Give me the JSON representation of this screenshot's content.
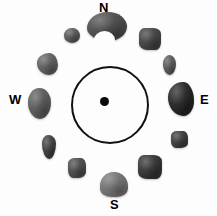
{
  "figure": {
    "background_color": "#fdfdfd",
    "width": 217,
    "height": 216
  },
  "center_marker": {
    "ring": {
      "name": "central-circle",
      "center_x": 110,
      "center_y": 105,
      "diameter": 78,
      "stroke_color": "#111111",
      "stroke_width": 2,
      "fill": "none"
    },
    "dot": {
      "name": "center-dot",
      "center_x": 104,
      "center_y": 101,
      "diameter": 9,
      "color": "#0a0a0a"
    }
  },
  "cardinals": [
    {
      "label": "N",
      "name": "cardinal-north",
      "x": 99,
      "y": 1,
      "color": "#000000"
    },
    {
      "label": "E",
      "name": "cardinal-east",
      "x": 200,
      "y": 93,
      "color": "#000000"
    },
    {
      "label": "S",
      "name": "cardinal-south",
      "x": 110,
      "y": 198,
      "color": "#000000"
    },
    {
      "label": "W",
      "name": "cardinal-west",
      "x": 9,
      "y": 93,
      "color": "#000000"
    }
  ],
  "stones": [
    {
      "id": 1,
      "position_label": "north",
      "x": 87,
      "y": 12,
      "w": 40,
      "h": 29,
      "shape": "kidney",
      "color": "#4f4f4f"
    },
    {
      "id": 2,
      "position_label": "north-northwest",
      "x": 64,
      "y": 28,
      "w": 16,
      "h": 15,
      "shape": "round",
      "color": "#5b5b5b"
    },
    {
      "id": 3,
      "position_label": "northeast",
      "x": 139,
      "y": 28,
      "w": 22,
      "h": 22,
      "shape": "angular",
      "color": "#454545"
    },
    {
      "id": 4,
      "position_label": "northwest",
      "x": 37,
      "y": 53,
      "w": 21,
      "h": 22,
      "shape": "blob",
      "color": "#636363"
    },
    {
      "id": 5,
      "position_label": "east-northeast",
      "x": 163,
      "y": 55,
      "w": 13,
      "h": 20,
      "shape": "oval",
      "color": "#5c5c5c"
    },
    {
      "id": 6,
      "position_label": "west",
      "x": 28,
      "y": 88,
      "w": 23,
      "h": 31,
      "shape": "oval",
      "color": "#5e5e5e"
    },
    {
      "id": 7,
      "position_label": "east",
      "x": 168,
      "y": 82,
      "w": 26,
      "h": 34,
      "shape": "blob",
      "color": "#262626"
    },
    {
      "id": 8,
      "position_label": "west-southwest",
      "x": 42,
      "y": 135,
      "w": 14,
      "h": 24,
      "shape": "long",
      "color": "#3f3f3f"
    },
    {
      "id": 9,
      "position_label": "east-southeast",
      "x": 171,
      "y": 131,
      "w": 17,
      "h": 17,
      "shape": "chunk",
      "color": "#3d3d3d"
    },
    {
      "id": 10,
      "position_label": "southwest",
      "x": 68,
      "y": 158,
      "w": 18,
      "h": 20,
      "shape": "chunk",
      "color": "#4e4e4e"
    },
    {
      "id": 11,
      "position_label": "southeast",
      "x": 138,
      "y": 155,
      "w": 24,
      "h": 24,
      "shape": "angular",
      "color": "#363636"
    },
    {
      "id": 12,
      "position_label": "south",
      "x": 100,
      "y": 172,
      "w": 28,
      "h": 25,
      "shape": "teard",
      "color": "#777777"
    }
  ]
}
